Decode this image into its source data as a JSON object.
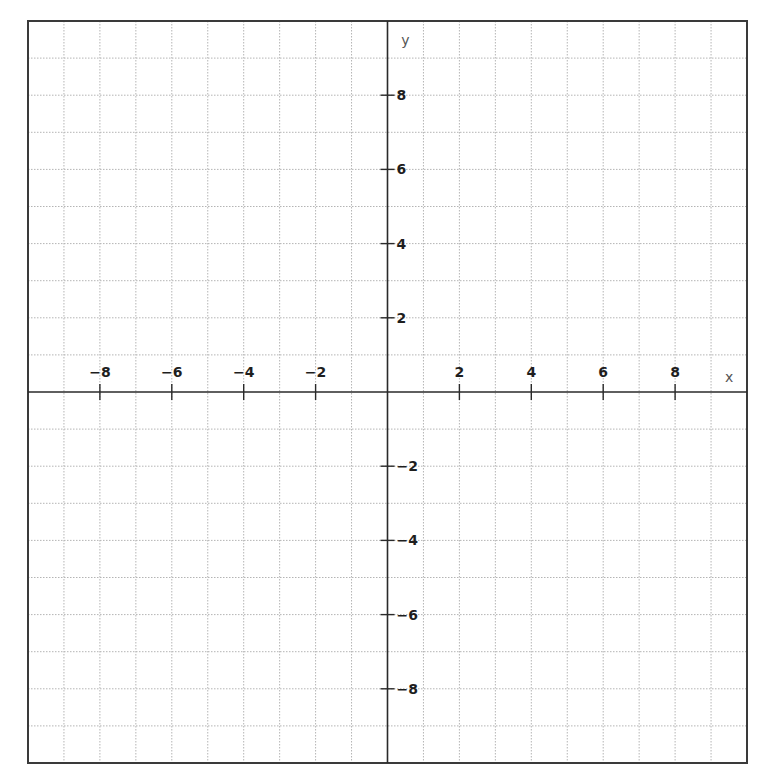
{
  "chart_data": {
    "type": "scatter",
    "title": "",
    "xlabel": "x",
    "ylabel": "y",
    "xlim": [
      -10,
      10
    ],
    "ylim": [
      -10,
      10
    ],
    "grid": true,
    "grid_step": 1,
    "x_ticks": [
      -8,
      -6,
      -4,
      -2,
      2,
      4,
      6,
      8
    ],
    "y_ticks": [
      8,
      6,
      4,
      2,
      -2,
      -4,
      -6,
      -8
    ],
    "x_tick_labels": [
      "−8",
      "−6",
      "−4",
      "−2",
      "2",
      "4",
      "6",
      "8"
    ],
    "y_tick_labels": [
      "8",
      "6",
      "4",
      "2",
      "−2",
      "−4",
      "−6",
      "−8"
    ],
    "series": []
  }
}
